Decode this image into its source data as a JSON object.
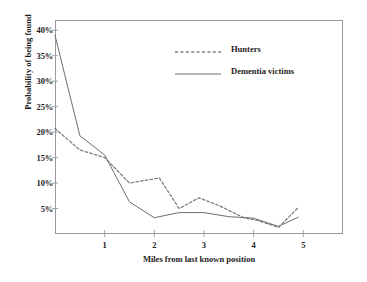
{
  "chart_data": {
    "type": "line",
    "title": "",
    "xlabel": "Miles from last known position",
    "ylabel": "Probability of being found",
    "xlim": [
      0,
      5.8
    ],
    "ylim": [
      0,
      42
    ],
    "grid": false,
    "legend_position": "top-right",
    "xticks": [
      {
        "value": 1,
        "label": "1"
      },
      {
        "value": 2,
        "label": "2"
      },
      {
        "value": 3,
        "label": "3"
      },
      {
        "value": 4,
        "label": "4"
      },
      {
        "value": 5,
        "label": "5"
      }
    ],
    "yticks": [
      {
        "value": 5,
        "label": "5%"
      },
      {
        "value": 10,
        "label": "10%"
      },
      {
        "value": 15,
        "label": "15%"
      },
      {
        "value": 20,
        "label": "20%"
      },
      {
        "value": 25,
        "label": "25%"
      },
      {
        "value": 30,
        "label": "30%"
      },
      {
        "value": 35,
        "label": "35%"
      },
      {
        "value": 40,
        "label": "40%"
      }
    ],
    "series": [
      {
        "name": "Hunters",
        "style": "dashed",
        "color": "#7d7d7d",
        "x": [
          0.0,
          0.5,
          1.0,
          1.5,
          2.1,
          2.5,
          2.9,
          3.3,
          3.8,
          4.1,
          4.5,
          4.9
        ],
        "values": [
          20.7,
          16.5,
          15.0,
          10.0,
          11.0,
          5.0,
          7.1,
          5.6,
          3.2,
          2.6,
          1.3,
          5.2
        ]
      },
      {
        "name": "Dementia victims",
        "style": "solid",
        "color": "#6e6e6e",
        "x": [
          0.0,
          0.5,
          1.0,
          1.5,
          2.0,
          2.5,
          3.0,
          3.5,
          4.0,
          4.5,
          4.9
        ],
        "values": [
          39.0,
          19.3,
          15.5,
          6.3,
          3.2,
          4.2,
          4.2,
          3.4,
          3.1,
          1.5,
          3.3
        ]
      }
    ]
  },
  "legend": {
    "items": [
      {
        "label": "Hunters"
      },
      {
        "label": "Dementia victims"
      }
    ]
  }
}
